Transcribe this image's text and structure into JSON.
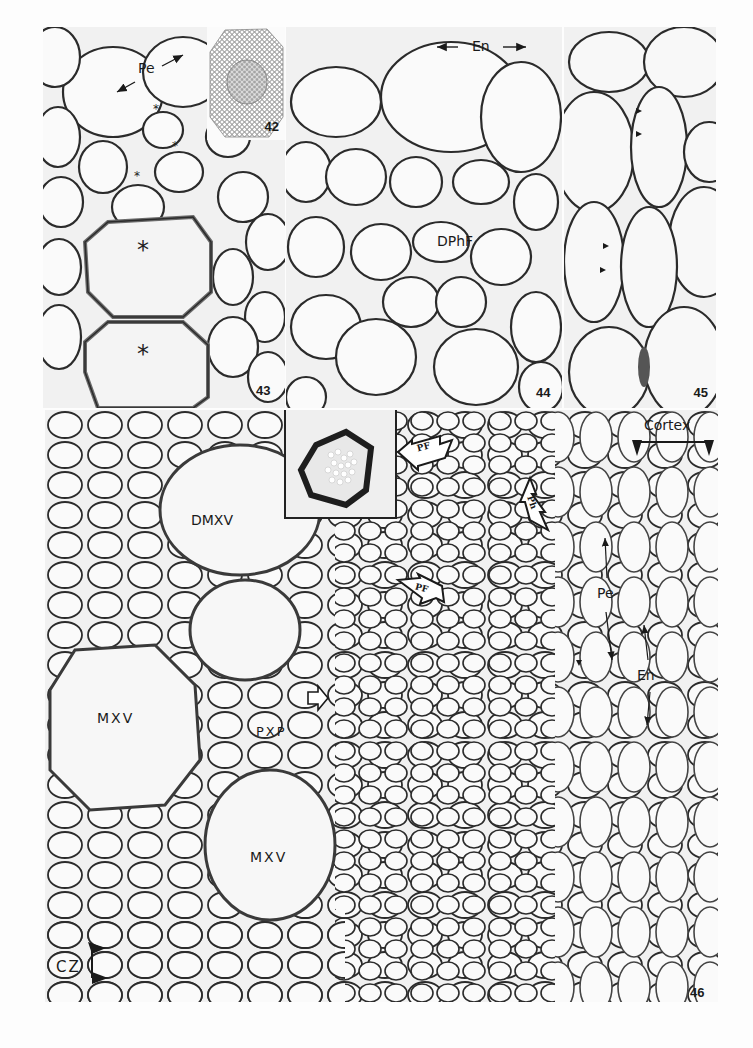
{
  "plate": {
    "panels": [
      {
        "id": "42",
        "number": "42",
        "description": "Low-magnification transverse section of root"
      },
      {
        "id": "43",
        "number": "43",
        "description": "Pericycle and late metaxylem elements"
      },
      {
        "id": "44",
        "number": "44",
        "description": "Endodermis and differentiating phloem fibres"
      },
      {
        "id": "45",
        "number": "45",
        "description": "Cell walls with arrowheads"
      },
      {
        "id": "46",
        "number": "46",
        "description": "Stele with metaxylem and protophloem"
      }
    ]
  },
  "labels": {
    "p43_pe": "Pe",
    "p43_star": "*",
    "p44_en": "En",
    "p44_dphf": "DPhF",
    "p46_dmxv": "DMXV",
    "p46_mxv_1": "MXV",
    "p46_mxv_2": "MXV",
    "p46_pxp": "PXP",
    "p46_cortex": "Cortex",
    "p46_pe": "Pe",
    "p46_en": "En",
    "p46_cz": "CZ",
    "p46_arrow_pf_1": "PF",
    "p46_arrow_pf_2": "Ph",
    "p46_arrow_pf_3": "PF"
  },
  "colors": {
    "background": "#fdfdfd",
    "tissue": "#f1f1f1",
    "cell_wall": "#2a2a2a",
    "label": "#1a1a1a"
  }
}
